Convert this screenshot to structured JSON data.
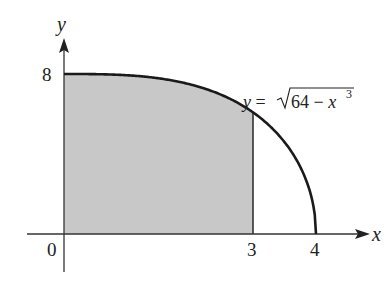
{
  "diagram": {
    "type": "area-under-curve",
    "function_label": {
      "prefix": "y = ",
      "radicand": "64 − x",
      "exponent": "3"
    },
    "axes": {
      "x_label": "x",
      "y_label": "y",
      "origin_label": "0"
    },
    "ticks": {
      "x": [
        "3",
        "4"
      ],
      "y": [
        "8"
      ]
    },
    "shaded_region": {
      "x_from": 0,
      "x_to": 3,
      "fill": "#c8c8c8"
    },
    "colors": {
      "curve": "#1a1a1a",
      "axes": "#333333",
      "fill": "#c8c8c8"
    }
  }
}
